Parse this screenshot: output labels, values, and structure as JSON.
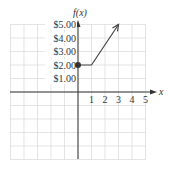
{
  "chart_data": {
    "type": "line",
    "title": "",
    "xlabel": "x",
    "ylabel": "f(x)",
    "xlim": [
      -5,
      5
    ],
    "ylim": [
      -5,
      5
    ],
    "grid": true,
    "x_ticks": [
      "1",
      "2",
      "3",
      "4",
      "5"
    ],
    "y_ticks": [
      "$1.00",
      "$2.00",
      "$3.00",
      "$4.00",
      "$5.00"
    ],
    "series": [
      {
        "name": "f(x)",
        "points": [
          [
            0,
            2
          ],
          [
            1,
            2
          ],
          [
            3,
            5
          ]
        ],
        "start_marker": "closed-dot",
        "end_marker": "arrow"
      }
    ],
    "colors": {
      "axis": "#333333",
      "grid": "#d9d9d9",
      "line": "#444444"
    }
  }
}
